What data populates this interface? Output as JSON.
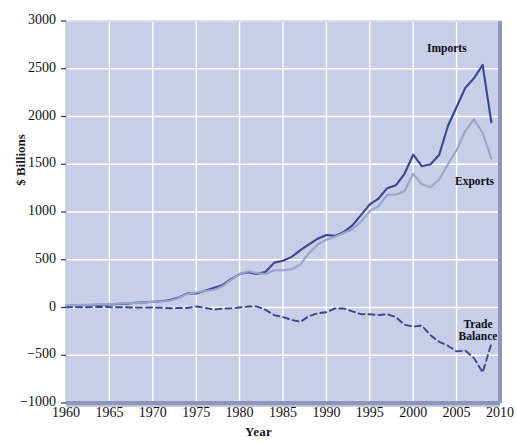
{
  "chart": {
    "title": "",
    "xlabel": "Year",
    "ylabel": "$ Billions",
    "y_ticks": [
      "3000",
      "2500",
      "2000",
      "1500",
      "1000",
      "500",
      "0",
      "-500",
      "-1000"
    ],
    "x_ticks": [
      "1960",
      "1965",
      "1970",
      "1975",
      "1980",
      "1985",
      "1990",
      "1995",
      "2000",
      "2005",
      "2010"
    ],
    "series_labels": {
      "imports": "Imports",
      "exports": "Exports",
      "trade_balance_line1": "Trade",
      "trade_balance_line2": "Balance"
    },
    "colors": {
      "plot_background": "#c6cce6",
      "gridline": "#ffffff",
      "imports_line": "#3b4490",
      "exports_line": "#9aa3cd",
      "trade_balance_line": "#3b4490",
      "axis_frame": "#8d95bb",
      "text": "#111111"
    }
  },
  "chart_data": {
    "type": "line",
    "title": "",
    "xlabel": "Year",
    "ylabel": "$ Billions",
    "xlim": [
      1960,
      2010
    ],
    "ylim": [
      -1000,
      3000
    ],
    "grid": true,
    "legend": "inline-annotations",
    "x": [
      1960,
      1961,
      1962,
      1963,
      1964,
      1965,
      1966,
      1967,
      1968,
      1969,
      1970,
      1971,
      1972,
      1973,
      1974,
      1975,
      1976,
      1977,
      1978,
      1979,
      1980,
      1981,
      1982,
      1983,
      1984,
      1985,
      1986,
      1987,
      1988,
      1989,
      1990,
      1991,
      1992,
      1993,
      1994,
      1995,
      1996,
      1997,
      1998,
      1999,
      2000,
      2001,
      2002,
      2003,
      2004,
      2005,
      2006,
      2007,
      2008,
      2009
    ],
    "series": [
      {
        "name": "Imports",
        "color": "#3b4490",
        "style": "solid",
        "values": [
          23,
          23,
          25,
          26,
          29,
          32,
          38,
          41,
          49,
          54,
          60,
          66,
          79,
          105,
          148,
          147,
          176,
          204,
          233,
          298,
          350,
          370,
          350,
          375,
          470,
          490,
          530,
          600,
          660,
          720,
          760,
          750,
          790,
          860,
          970,
          1080,
          1140,
          1250,
          1280,
          1400,
          1600,
          1480,
          1500,
          1600,
          1900,
          2100,
          2300,
          2400,
          2540,
          1940
        ]
      },
      {
        "name": "Exports",
        "color": "#9aa3cd",
        "style": "solid",
        "values": [
          26,
          26,
          28,
          30,
          34,
          36,
          40,
          44,
          48,
          53,
          60,
          63,
          71,
          99,
          143,
          157,
          173,
          183,
          220,
          290,
          350,
          380,
          360,
          350,
          390,
          390,
          400,
          450,
          570,
          660,
          710,
          740,
          780,
          820,
          900,
          1010,
          1060,
          1180,
          1180,
          1220,
          1400,
          1290,
          1260,
          1340,
          1500,
          1650,
          1850,
          1970,
          1830,
          1560
        ]
      },
      {
        "name": "Trade Balance",
        "color": "#3b4490",
        "style": "dashed",
        "values": [
          3,
          4,
          3,
          4,
          6,
          4,
          2,
          3,
          -1,
          -1,
          0,
          -3,
          -8,
          -6,
          -5,
          10,
          -3,
          -21,
          -13,
          -8,
          0,
          10,
          10,
          -25,
          -80,
          -100,
          -130,
          -150,
          -90,
          -60,
          -50,
          -10,
          -10,
          -40,
          -70,
          -70,
          -80,
          -70,
          -100,
          -180,
          -200,
          -190,
          -290,
          -360,
          -400,
          -460,
          -450,
          -530,
          -680,
          -380
        ]
      }
    ],
    "annotations": [
      {
        "text": "Imports",
        "x": 2007,
        "y": 2700
      },
      {
        "text": "Exports",
        "x": 2007,
        "y": 1150
      },
      {
        "text": "Trade Balance",
        "x": 2006,
        "y": -440
      }
    ]
  }
}
